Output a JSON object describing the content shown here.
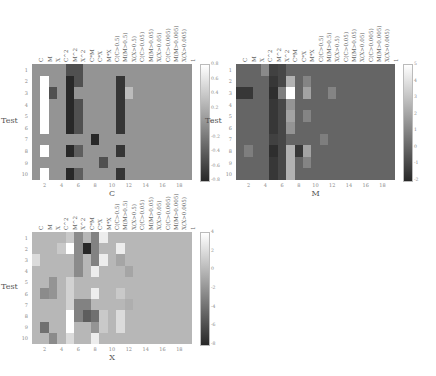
{
  "chart_data": [
    {
      "type": "heatmap",
      "title": "",
      "xlabel": "C",
      "ylabel": "Test",
      "columns": [
        "C",
        "M",
        "X",
        "C^2",
        "M^2",
        "X^2",
        "C*M",
        "C*X",
        "M*X",
        "C(C>0.5)",
        "M(M>0.5)",
        "X(X>0.5)",
        "C(C>0.05)",
        "M(M>0.05)",
        "X(X>0.05)",
        "C(C>0.005)",
        "M(M>0.005)",
        "X(X>0.005)",
        "1"
      ],
      "rows": [
        "1",
        "2",
        "3",
        "4",
        "5",
        "6",
        "7",
        "8",
        "9",
        "10"
      ],
      "x_ticks": [
        "2",
        "4",
        "6",
        "8",
        "10",
        "12",
        "14",
        "16",
        "18"
      ],
      "colorbar": {
        "min": -0.8,
        "max": 0.8,
        "ticks": [
          "0.8",
          "0.6",
          "0.4",
          "0.2",
          "0",
          "-0.2",
          "-0.4",
          "-0.6",
          "-0.8"
        ]
      },
      "values": [
        [
          0,
          0,
          0,
          0,
          -0.5,
          -0.5,
          0,
          0,
          0,
          0,
          0,
          0,
          0,
          0,
          0,
          0,
          0,
          0,
          0
        ],
        [
          0,
          0.8,
          0,
          0,
          -0.8,
          -0.5,
          0,
          0,
          0,
          0,
          -0.7,
          0,
          0,
          0,
          0,
          0,
          0,
          0,
          0
        ],
        [
          0,
          0.8,
          -0.5,
          0,
          -0.8,
          0,
          0,
          0,
          0,
          0,
          -0.7,
          0.3,
          0,
          0,
          0,
          0,
          0,
          0,
          0
        ],
        [
          0,
          0.8,
          0,
          0,
          -0.8,
          -0.5,
          0,
          0,
          0,
          0,
          -0.7,
          0,
          0,
          0,
          0,
          0,
          0,
          0,
          0
        ],
        [
          0,
          0.8,
          0,
          0,
          -0.8,
          -0.5,
          0,
          0,
          0,
          0,
          -0.7,
          0,
          0,
          0,
          0,
          0,
          0,
          0,
          0
        ],
        [
          0,
          0.8,
          0,
          0,
          -0.8,
          -0.5,
          0,
          0,
          0,
          0,
          -0.7,
          0,
          0,
          0,
          0,
          0,
          0,
          0,
          0
        ],
        [
          0,
          0,
          0,
          0,
          0,
          0,
          0,
          -0.8,
          0,
          0,
          0,
          0,
          0,
          0,
          0,
          0,
          0,
          0,
          0
        ],
        [
          0,
          0.8,
          0,
          0,
          -0.8,
          -0.4,
          0,
          0,
          0,
          0,
          -0.7,
          0,
          0,
          0,
          0,
          0,
          0,
          0,
          0
        ],
        [
          0,
          0,
          0,
          0,
          0,
          0,
          0,
          0,
          -0.5,
          0,
          0,
          0,
          0,
          0,
          0,
          0,
          0,
          0,
          0
        ],
        [
          0,
          0.8,
          0,
          0,
          -0.8,
          -0.4,
          0,
          0,
          0,
          0,
          -0.7,
          0,
          0,
          0,
          0,
          0,
          0,
          0,
          0
        ]
      ]
    },
    {
      "type": "heatmap",
      "title": "",
      "xlabel": "M",
      "ylabel": "Test",
      "columns": [
        "C",
        "M",
        "X",
        "C^2",
        "M^2",
        "X^2",
        "C*M",
        "C*X",
        "M*X",
        "C(C>0.5)",
        "M(M>0.5)",
        "X(X>0.5)",
        "C(C>0.05)",
        "M(M>0.05)",
        "X(X>0.05)",
        "C(C>0.005)",
        "M(M>0.005)",
        "X(X>0.005)",
        "1"
      ],
      "rows": [
        "1",
        "2",
        "3",
        "4",
        "5",
        "6",
        "7",
        "8",
        "9",
        "10"
      ],
      "x_ticks": [
        "2",
        "4",
        "6",
        "8",
        "10",
        "12",
        "14",
        "16",
        "18"
      ],
      "colorbar": {
        "min": -2,
        "max": 5,
        "ticks": [
          "5",
          "4",
          "3",
          "2",
          "1",
          "0",
          "-1",
          "-2"
        ]
      },
      "values": [
        [
          0,
          0,
          0,
          1.2,
          -1.2,
          -1.0,
          0,
          0,
          0,
          0,
          0,
          0,
          0,
          0,
          0,
          0,
          0,
          0,
          0
        ],
        [
          0,
          0,
          0,
          0,
          -1.5,
          -1.0,
          2.5,
          0,
          1.0,
          0,
          0,
          0,
          0,
          0,
          0,
          0,
          0,
          0,
          0
        ],
        [
          -1.5,
          -1.5,
          0,
          0,
          -1.8,
          0.8,
          5,
          0,
          2.0,
          0,
          0,
          1.0,
          0,
          0,
          0,
          0,
          0,
          0,
          0
        ],
        [
          0,
          0,
          0,
          0,
          -1.5,
          -1.0,
          1.5,
          0,
          0,
          0,
          0,
          0,
          0,
          0,
          0,
          0,
          0,
          0,
          0
        ],
        [
          0,
          0,
          0,
          0,
          -1.5,
          -1.0,
          2.0,
          0,
          1.0,
          0,
          0,
          0,
          0,
          0,
          0,
          0,
          0,
          0,
          0
        ],
        [
          0,
          0,
          0,
          0,
          -1.5,
          -1.0,
          1.5,
          0,
          0,
          0,
          0,
          0,
          0,
          0,
          0,
          0,
          0,
          0,
          0
        ],
        [
          0,
          0,
          0,
          0,
          -1.2,
          -1.0,
          0,
          0,
          0,
          0,
          0.8,
          0,
          0,
          0,
          0,
          0,
          0,
          0,
          0
        ],
        [
          0,
          0.8,
          0,
          0,
          -1.8,
          -1.0,
          2.5,
          -1.5,
          2.0,
          0,
          0,
          0,
          0,
          0,
          0,
          0,
          0,
          0,
          0
        ],
        [
          0,
          0,
          0,
          0,
          -1.5,
          -1.0,
          2.5,
          0,
          1.0,
          0,
          0,
          0,
          0,
          0,
          0,
          0,
          0,
          0,
          0
        ],
        [
          0,
          0,
          0,
          0,
          -1.5,
          -1.0,
          2.5,
          0,
          0,
          0,
          0,
          0,
          0,
          0,
          0,
          0,
          0,
          0,
          0
        ]
      ]
    },
    {
      "type": "heatmap",
      "title": "",
      "xlabel": "X",
      "ylabel": "Test",
      "columns": [
        "C",
        "M",
        "X",
        "C^2",
        "M^2",
        "X^2",
        "C*M",
        "C*X",
        "M*X",
        "C(C>0.5)",
        "M(M>0.5)",
        "X(X>0.5)",
        "C(C>0.05)",
        "M(M>0.05)",
        "X(X>0.05)",
        "C(C>0.005)",
        "M(M>0.005)",
        "X(X>0.005)",
        "1"
      ],
      "rows": [
        "1",
        "2",
        "3",
        "4",
        "5",
        "6",
        "7",
        "8",
        "9",
        "10"
      ],
      "x_ticks": [
        "2",
        "4",
        "6",
        "8",
        "10",
        "12",
        "14",
        "16",
        "18"
      ],
      "colorbar": {
        "min": -8,
        "max": 4,
        "ticks": [
          "4",
          "2",
          "0",
          "-2",
          "-4",
          "-6",
          "-8"
        ]
      },
      "values": [
        [
          0,
          0,
          0,
          0,
          1,
          -2.5,
          0,
          -3,
          3,
          0,
          0,
          0,
          0,
          0,
          0,
          0,
          0,
          0,
          0
        ],
        [
          0,
          0,
          0,
          1,
          4,
          -2.5,
          -8,
          -3,
          0,
          0,
          3,
          0,
          0,
          0,
          0,
          0,
          0,
          0,
          0
        ],
        [
          2,
          0,
          0,
          0,
          0,
          -2.5,
          0,
          -3,
          3,
          0,
          -1,
          0,
          0,
          0,
          0,
          0,
          0,
          0,
          0
        ],
        [
          0,
          0,
          0,
          0,
          0,
          -2.5,
          0,
          3,
          0,
          0,
          0,
          -1,
          0,
          0,
          0,
          0,
          0,
          0,
          0
        ],
        [
          0,
          0,
          -2,
          0,
          1.5,
          0,
          0,
          0,
          0,
          0,
          0,
          0,
          0,
          0,
          0,
          0,
          0,
          0,
          0
        ],
        [
          0,
          -2.5,
          -2,
          0,
          1.5,
          0,
          0,
          3,
          0,
          0,
          1,
          0,
          0,
          0,
          0,
          0,
          0,
          0,
          0
        ],
        [
          0,
          0,
          0,
          0,
          1.5,
          -3,
          -3,
          0,
          0,
          0,
          0,
          -0.5,
          0,
          0,
          0,
          0,
          0,
          0,
          0
        ],
        [
          0,
          0,
          0,
          0,
          4,
          -3,
          -5,
          -4,
          1,
          0,
          2,
          0,
          0,
          0,
          0,
          0,
          0,
          0,
          0
        ],
        [
          0,
          -4,
          0,
          0,
          4,
          0,
          0,
          -2,
          1,
          0,
          2,
          0,
          0,
          0,
          0,
          0,
          0,
          0,
          0
        ],
        [
          0,
          0,
          -2.5,
          0,
          2,
          0,
          0,
          3,
          0,
          0,
          0,
          0,
          0,
          0,
          0,
          0,
          0,
          0,
          0
        ]
      ]
    }
  ],
  "layout": {
    "panels": [
      {
        "left": 32,
        "top": 64,
        "width": 160,
        "height": 116,
        "cbar_left": 200,
        "cbar_top": 64,
        "cbar_width": 8,
        "cbar_height": 116
      },
      {
        "left": 236,
        "top": 64,
        "width": 159,
        "height": 116,
        "cbar_left": 403,
        "cbar_top": 64,
        "cbar_width": 8,
        "cbar_height": 116
      },
      {
        "left": 32,
        "top": 232,
        "width": 160,
        "height": 112,
        "cbar_left": 200,
        "cbar_top": 232,
        "cbar_width": 8,
        "cbar_height": 112
      }
    ]
  }
}
